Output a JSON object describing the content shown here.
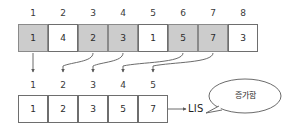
{
  "diagram": {
    "title_text": "",
    "colors": {
      "shaded_cell": "#cccccc",
      "cell_border": "#6e6e6e",
      "arrow": "#5a5a5a",
      "text": "#2b2b2b",
      "background": "#ffffff"
    },
    "top_sequence": {
      "name": "input-array",
      "indices": [
        "1",
        "2",
        "3",
        "4",
        "5",
        "6",
        "7",
        "8"
      ],
      "values": [
        "1",
        "4",
        "2",
        "3",
        "1",
        "5",
        "7",
        "3"
      ],
      "shaded": [
        true,
        false,
        true,
        true,
        false,
        true,
        true,
        false
      ]
    },
    "bottom_sequence": {
      "name": "lis-array",
      "indices": [
        "1",
        "2",
        "3",
        "4",
        "5"
      ],
      "values": [
        "1",
        "2",
        "3",
        "5",
        "7"
      ],
      "shaded": [
        false,
        false,
        false,
        false,
        false
      ]
    },
    "result_label": "LIS",
    "callout": {
      "text": "증가함"
    },
    "mapping": [
      {
        "from_index": "1",
        "to_index": "1"
      },
      {
        "from_index": "3",
        "to_index": "2"
      },
      {
        "from_index": "4",
        "to_index": "3"
      },
      {
        "from_index": "6",
        "to_index": "4"
      },
      {
        "from_index": "7",
        "to_index": "5"
      }
    ]
  }
}
